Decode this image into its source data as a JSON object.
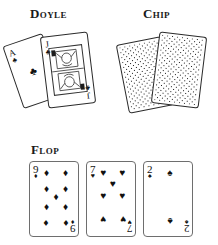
{
  "figure": {
    "background_color": "#ffffff",
    "ink_color": "#1a1a1a"
  },
  "sections": {
    "doyle": {
      "label": "Doyle",
      "kind": "hole-cards-face-up",
      "cards": [
        {
          "rank": "A",
          "suit": "clubs",
          "suit_symbol": "♣",
          "name": "ace-of-clubs",
          "orientation": "tilted-left"
        },
        {
          "rank": "J",
          "suit": "clubs",
          "suit_symbol": "♣",
          "name": "jack-of-clubs",
          "orientation": "tilted-left",
          "face_card": true
        }
      ]
    },
    "chip": {
      "label": "Chip",
      "kind": "hole-cards-face-down",
      "cards": [
        {
          "name": "face-down-card-left",
          "pattern": "lattice"
        },
        {
          "name": "face-down-card-right",
          "pattern": "lattice"
        }
      ]
    },
    "flop": {
      "label": "Flop",
      "kind": "community-cards",
      "cards": [
        {
          "rank": "9",
          "suit": "diamonds",
          "suit_symbol": "♦",
          "name": "nine-of-diamonds",
          "count": 9
        },
        {
          "rank": "7",
          "suit": "hearts",
          "suit_symbol": "♥",
          "name": "seven-of-hearts",
          "count": 7
        },
        {
          "rank": "2",
          "suit": "spades",
          "suit_symbol": "♠",
          "name": "two-of-spades",
          "count": 2
        }
      ]
    }
  }
}
